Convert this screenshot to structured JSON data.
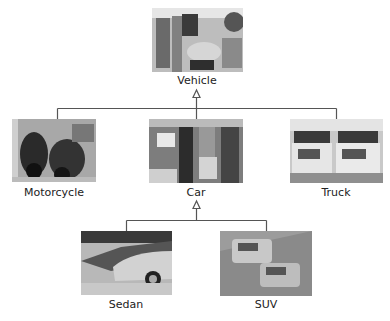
{
  "diagram": {
    "type": "class-hierarchy",
    "nodes": [
      {
        "id": "vehicle",
        "label": "Vehicle",
        "image": "traffic-jam-photo",
        "parent": null
      },
      {
        "id": "motorcycle",
        "label": "Motorcycle",
        "image": "motorcycles-photo",
        "parent": "vehicle"
      },
      {
        "id": "car",
        "label": "Car",
        "image": "parking-lot-photo",
        "parent": "vehicle"
      },
      {
        "id": "truck",
        "label": "Truck",
        "image": "dump-trucks-photo",
        "parent": "vehicle"
      },
      {
        "id": "sedan",
        "label": "Sedan",
        "image": "sedans-row-photo",
        "parent": "car"
      },
      {
        "id": "suv",
        "label": "SUV",
        "image": "suvs-road-photo",
        "parent": "car"
      }
    ],
    "edge_style": "inheritance-hollow-arrow",
    "colors": {
      "line": "#555555",
      "text": "#222222",
      "background": "#ffffff"
    }
  }
}
